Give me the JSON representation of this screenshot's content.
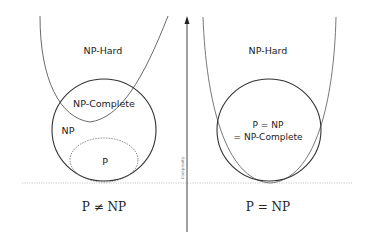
{
  "diagram": {
    "axis": {
      "label": "Complexity"
    },
    "left": {
      "np_hard_label": "NP-Hard",
      "np_complete_label": "NP-Complete",
      "np_label": "NP",
      "p_label": "P",
      "caption": "P ≠ NP"
    },
    "right": {
      "np_hard_label": "NP-Hard",
      "merged_label_line1": "P = NP",
      "merged_label_line2": "= NP-Complete",
      "caption": "P = NP"
    }
  }
}
